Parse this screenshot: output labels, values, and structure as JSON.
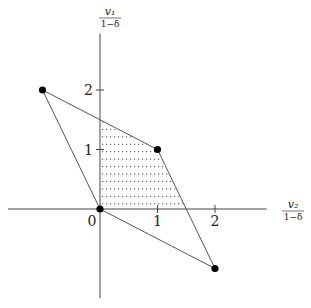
{
  "chart_data": {
    "type": "diagram",
    "title": "",
    "xlabel_num": "v₂",
    "xlabel_den": "1−δ",
    "ylabel_num": "v₁",
    "ylabel_den": "1−δ",
    "xlim": [
      -1.6,
      2.9
    ],
    "ylim": [
      -1.5,
      2.95
    ],
    "x_ticks": [
      {
        "v": 1,
        "label": "1"
      },
      {
        "v": 2,
        "label": "2"
      }
    ],
    "y_ticks": [
      {
        "v": 1,
        "label": "1"
      },
      {
        "v": 2,
        "label": "2"
      }
    ],
    "origin_label": "0",
    "polygon": [
      [
        -1,
        2
      ],
      [
        1,
        1
      ],
      [
        2,
        -1
      ],
      [
        0,
        0
      ]
    ],
    "points": [
      [
        -1,
        2
      ],
      [
        1,
        1
      ],
      [
        0,
        0
      ],
      [
        2,
        -1
      ]
    ],
    "shaded_region": {
      "vertices": [
        [
          0,
          0
        ],
        [
          0,
          1.5
        ],
        [
          1,
          1
        ],
        [
          1.5,
          0
        ]
      ],
      "pattern": "dotted-horizontal",
      "line_count": 12
    }
  }
}
